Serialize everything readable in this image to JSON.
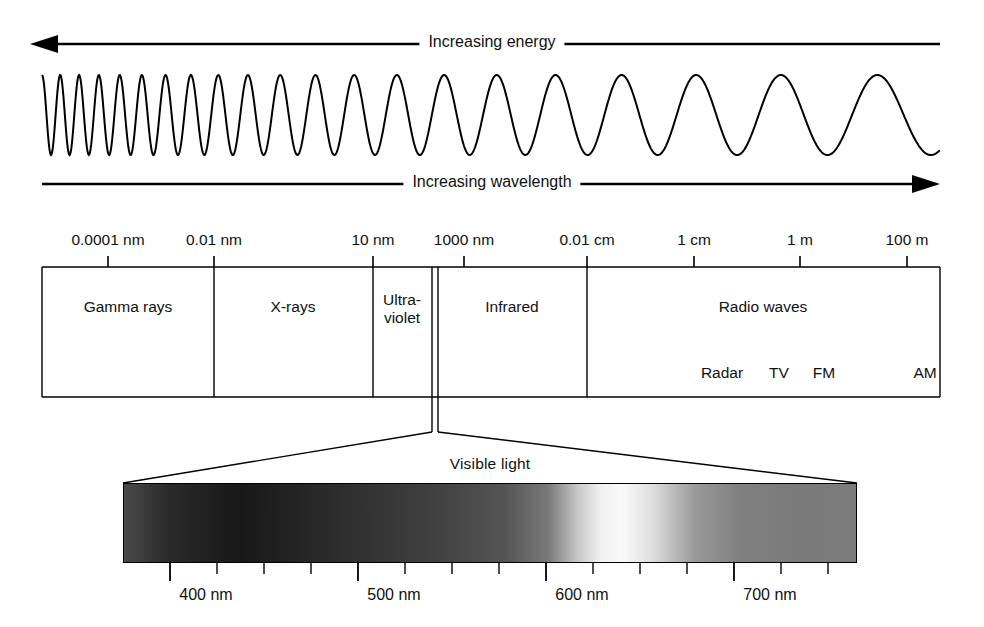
{
  "figure": {
    "background_color": "#ffffff",
    "line_color": "#000000"
  },
  "top_arrow": {
    "label": "Increasing energy",
    "direction": "left"
  },
  "bottom_arrow": {
    "label": "Increasing wavelength",
    "direction": "right"
  },
  "wave": {
    "description": "sine wave with wavelength increasing left to right"
  },
  "scale": {
    "ticks": [
      {
        "label": "0.0001 nm",
        "x": 108
      },
      {
        "label": "0.01 nm",
        "x": 214
      },
      {
        "label": "10 nm",
        "x": 373
      },
      {
        "label": "1000 nm",
        "x": 464
      },
      {
        "label": "0.01 cm",
        "x": 587
      },
      {
        "label": "1 cm",
        "x": 694
      },
      {
        "label": "1 m",
        "x": 800
      },
      {
        "label": "100 m",
        "x": 907
      }
    ]
  },
  "bands": [
    {
      "name": "Gamma rays",
      "label": "Gamma rays",
      "start": 42,
      "end": 214,
      "center": 128
    },
    {
      "name": "X-rays",
      "label": "X-rays",
      "start": 214,
      "end": 373,
      "center": 293
    },
    {
      "name": "Ultraviolet",
      "label": "Ultra-\nviolet",
      "label_line1": "Ultra-",
      "label_line2": "violet",
      "start": 373,
      "end": 432,
      "center": 402
    },
    {
      "name": "Visible",
      "label": "",
      "start": 432,
      "end": 438,
      "center": 435
    },
    {
      "name": "Infrared",
      "label": "Infrared",
      "start": 438,
      "end": 587,
      "center": 512
    },
    {
      "name": "Radio waves",
      "label": "Radio waves",
      "start": 587,
      "end": 940,
      "center": 763
    }
  ],
  "radio_sublabels": [
    {
      "label": "Radar",
      "x": 722
    },
    {
      "label": "TV",
      "x": 779
    },
    {
      "label": "FM",
      "x": 824
    },
    {
      "label": "AM",
      "x": 925
    }
  ],
  "visible_light": {
    "caption": "Visible light",
    "caption_x": 490,
    "bar": {
      "left": 123,
      "top": 483,
      "width": 734,
      "height": 80
    },
    "wavelength_ticks": [
      {
        "label": "400 nm",
        "x": 170,
        "major": true
      },
      {
        "label": "",
        "x": 217,
        "major": false
      },
      {
        "label": "",
        "x": 264,
        "major": false
      },
      {
        "label": "",
        "x": 311,
        "major": false
      },
      {
        "label": "500 nm",
        "x": 358,
        "major": true
      },
      {
        "label": "",
        "x": 405,
        "major": false
      },
      {
        "label": "",
        "x": 452,
        "major": false
      },
      {
        "label": "",
        "x": 499,
        "major": false
      },
      {
        "label": "600 nm",
        "x": 546,
        "major": true
      },
      {
        "label": "",
        "x": 593,
        "major": false
      },
      {
        "label": "",
        "x": 640,
        "major": false
      },
      {
        "label": "",
        "x": 687,
        "major": false
      },
      {
        "label": "700 nm",
        "x": 734,
        "major": true
      },
      {
        "label": "",
        "x": 781,
        "major": false
      },
      {
        "label": "",
        "x": 828,
        "major": false
      }
    ],
    "gradient_stops": [
      {
        "pos": 0,
        "color": "#4a4a4a"
      },
      {
        "pos": 6,
        "color": "#2a2a2a"
      },
      {
        "pos": 16,
        "color": "#181818"
      },
      {
        "pos": 30,
        "color": "#2e2e2e"
      },
      {
        "pos": 42,
        "color": "#404040"
      },
      {
        "pos": 52,
        "color": "#545454"
      },
      {
        "pos": 58,
        "color": "#7a7a7a"
      },
      {
        "pos": 62,
        "color": "#c8c8c8"
      },
      {
        "pos": 65,
        "color": "#f0f0f0"
      },
      {
        "pos": 68,
        "color": "#fafafa"
      },
      {
        "pos": 72,
        "color": "#e0e0e0"
      },
      {
        "pos": 78,
        "color": "#9a9a9a"
      },
      {
        "pos": 84,
        "color": "#808080"
      },
      {
        "pos": 92,
        "color": "#7a7a7a"
      },
      {
        "pos": 100,
        "color": "#7c7c7c"
      }
    ]
  }
}
